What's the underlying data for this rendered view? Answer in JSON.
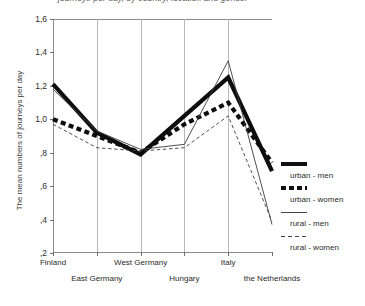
{
  "chart_data": {
    "type": "line",
    "title": "journeys per day, by country, location and gender",
    "ylabel": "The mean numbers of journeys per day",
    "xlabel": "",
    "categories": [
      "Finland",
      "East Germany",
      "West Germany",
      "Hungary",
      "Italy",
      "the Netherlands"
    ],
    "ylim": [
      0.2,
      1.6
    ],
    "yticks": [
      0.2,
      0.4,
      0.6,
      0.8,
      1.0,
      1.2,
      1.4,
      1.6
    ],
    "ytick_labels": [
      ",2",
      ",4",
      ",6",
      ",8",
      "1,0",
      "1,2",
      "1,4",
      "1,6"
    ],
    "grid": true,
    "legend_position": "right",
    "series": [
      {
        "name": "urban - men",
        "style": "thick-solid",
        "values": [
          1.21,
          0.92,
          0.79,
          1.02,
          1.25,
          0.69
        ]
      },
      {
        "name": "urban - women",
        "style": "thick-dash",
        "values": [
          1.0,
          0.9,
          0.8,
          0.97,
          1.1,
          0.74
        ]
      },
      {
        "name": "rural - men",
        "style": "thin-solid",
        "values": [
          1.18,
          0.93,
          0.82,
          0.85,
          1.35,
          0.37
        ]
      },
      {
        "name": "rural - women",
        "style": "thin-dash",
        "values": [
          0.97,
          0.83,
          0.81,
          0.83,
          1.02,
          0.39
        ]
      }
    ]
  },
  "legend": {
    "items": [
      {
        "label": "urban - men"
      },
      {
        "label": "urban - women"
      },
      {
        "label": "rural - men"
      },
      {
        "label": "rural - women"
      }
    ]
  }
}
